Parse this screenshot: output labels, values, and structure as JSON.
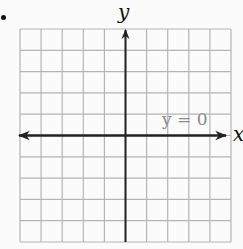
{
  "figure": {
    "bullet": "•",
    "x_axis_label": "x",
    "y_axis_label": "y",
    "equation_label": "y = 0",
    "colors": {
      "grid": "#b5b5b5",
      "axis": "#222222",
      "label": "#111111",
      "equation": "#8a8a8a",
      "background": "#fbfbfb"
    },
    "grid": {
      "columns": 10,
      "rows": 10,
      "left": 20,
      "top": 29,
      "right": 231,
      "bottom": 242
    },
    "axes": {
      "x_axis_row": 5,
      "y_axis_column": 5,
      "x_axis_arrows": [
        "left",
        "right"
      ],
      "y_axis_arrows": [
        "up"
      ]
    }
  },
  "chart_data": {
    "type": "line",
    "title": "",
    "xlabel": "x",
    "ylabel": "y",
    "xlim": [
      -5,
      5
    ],
    "ylim": [
      -5,
      5
    ],
    "grid": true,
    "series": [
      {
        "name": "y = 0",
        "x": [
          -5,
          5
        ],
        "values": [
          0,
          0
        ]
      }
    ],
    "annotations": [
      "y = 0"
    ]
  }
}
